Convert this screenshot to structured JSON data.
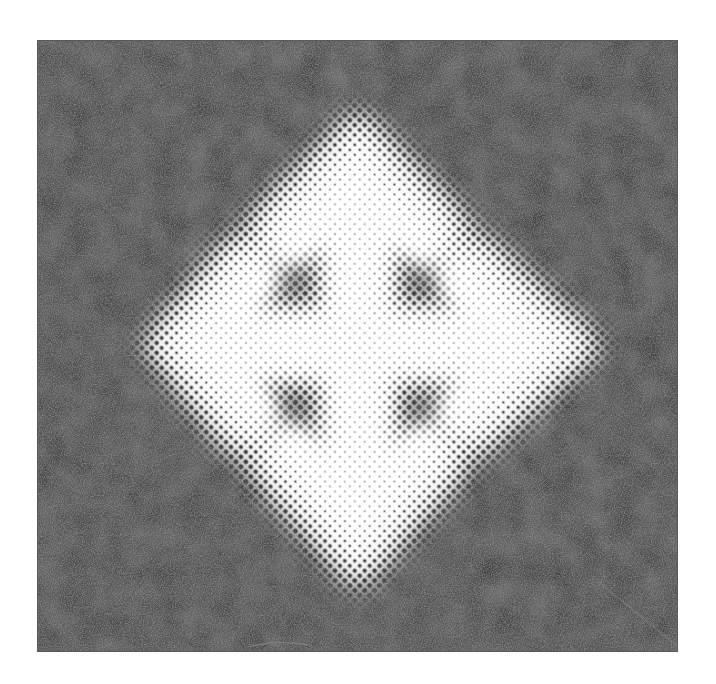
{
  "page": {
    "background_color": "#ffffff",
    "caption_top": ""
  },
  "image": {
    "subject": "four-way move cursor arrow",
    "icon": "move-arrows-icon",
    "style": "halftone dot screen",
    "panel": {
      "background_color": "#444444",
      "texture": "mottled dark gray"
    },
    "arrow_color": "#ffffff",
    "dot_color": "#1a1a1a"
  }
}
